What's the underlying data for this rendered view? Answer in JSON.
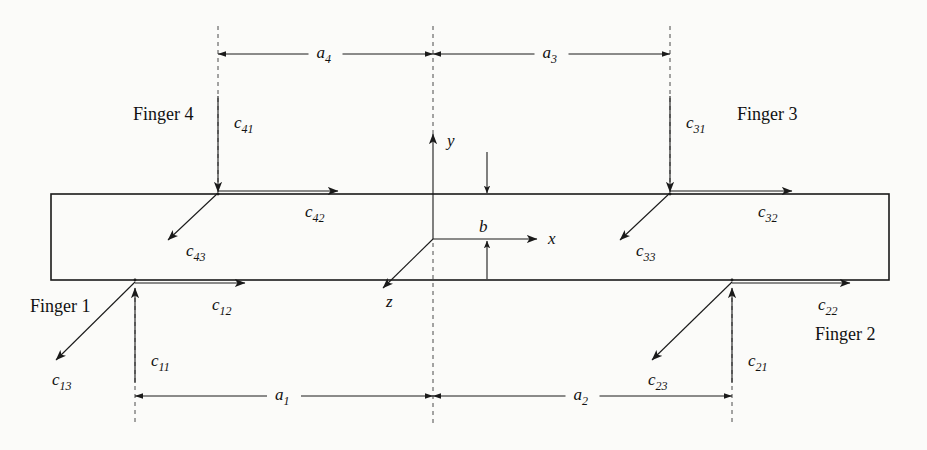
{
  "figure": {
    "background_color": "#fbfbf9",
    "ink_color": "#1a1a1a"
  },
  "object": {
    "name": "grasped-rectangular-body",
    "left": 51,
    "right": 889,
    "top": 194,
    "bottom": 280
  },
  "axes": {
    "origin": {
      "x": 433,
      "y": 239
    },
    "x_label": "x",
    "y_label": "y",
    "z_label": "z",
    "x_tip": {
      "x": 537,
      "y": 239
    },
    "y_tip": {
      "x": 433,
      "y": 134
    },
    "z_tip": {
      "x": 383,
      "y": 288
    }
  },
  "dimensions": {
    "b": {
      "label": "b",
      "label_x": 487,
      "label_y": 232,
      "top_arrow_from_y": 152,
      "top_arrow_to_y": 193,
      "bottom_arrow_from_y": 279,
      "bottom_arrow_to_y": 241,
      "arrow_x": 487
    },
    "a4": {
      "label": "a",
      "sub": "4",
      "from_x": 218,
      "to_x": 433,
      "y": 54
    },
    "a3": {
      "label": "a",
      "sub": "3",
      "from_x": 433,
      "to_x": 670,
      "y": 54
    },
    "a1": {
      "label": "a",
      "sub": "1",
      "from_x": 135,
      "to_x": 433,
      "y": 396
    },
    "a2": {
      "label": "a",
      "sub": "2",
      "from_x": 433,
      "to_x": 732,
      "y": 396
    }
  },
  "guides": [
    {
      "name": "guide-finger4",
      "x": 218,
      "y1": 26,
      "y2": 194
    },
    {
      "name": "guide-center-top",
      "x": 433,
      "y1": 26,
      "y2": 135
    },
    {
      "name": "guide-finger3",
      "x": 670,
      "y1": 26,
      "y2": 194
    },
    {
      "name": "guide-finger1",
      "x": 135,
      "y1": 290,
      "y2": 424
    },
    {
      "name": "guide-center-bottom",
      "x": 433,
      "y1": 243,
      "y2": 424
    },
    {
      "name": "guide-finger2",
      "x": 732,
      "y1": 290,
      "y2": 424
    }
  ],
  "fingers": [
    {
      "id": "finger-1",
      "name_label": "Finger 1",
      "name_x": 30,
      "name_y": 312,
      "contact": {
        "x": 135,
        "y": 280
      },
      "forces": [
        {
          "key": "c11",
          "base": "c",
          "sub": "11",
          "tip": {
            "x": 135,
            "y": 288
          },
          "tail": {
            "x": 135,
            "y": 383
          },
          "label_x": 151,
          "label_y": 366
        },
        {
          "key": "c12",
          "base": "c",
          "sub": "12",
          "tip": {
            "x": 245,
            "y": 283
          },
          "tail": {
            "x": 135,
            "y": 283
          },
          "label_x": 212,
          "label_y": 310
        },
        {
          "key": "c13",
          "base": "c",
          "sub": "13",
          "tip": {
            "x": 56,
            "y": 360
          },
          "tail": {
            "x": 135,
            "y": 282
          },
          "label_x": 52,
          "label_y": 385
        }
      ]
    },
    {
      "id": "finger-2",
      "name_label": "Finger 2",
      "name_x": 815,
      "name_y": 340,
      "contact": {
        "x": 732,
        "y": 280
      },
      "forces": [
        {
          "key": "c21",
          "base": "c",
          "sub": "21",
          "tip": {
            "x": 732,
            "y": 288
          },
          "tail": {
            "x": 732,
            "y": 383
          },
          "label_x": 748,
          "label_y": 366
        },
        {
          "key": "c22",
          "base": "c",
          "sub": "22",
          "tip": {
            "x": 850,
            "y": 283
          },
          "tail": {
            "x": 732,
            "y": 283
          },
          "label_x": 818,
          "label_y": 310
        },
        {
          "key": "c23",
          "base": "c",
          "sub": "23",
          "tip": {
            "x": 652,
            "y": 360
          },
          "tail": {
            "x": 732,
            "y": 282
          },
          "label_x": 648,
          "label_y": 385
        }
      ]
    },
    {
      "id": "finger-3",
      "name_label": "Finger 3",
      "name_x": 737,
      "name_y": 120,
      "contact": {
        "x": 670,
        "y": 194
      },
      "forces": [
        {
          "key": "c31",
          "base": "c",
          "sub": "31",
          "tip": {
            "x": 670,
            "y": 192
          },
          "tail": {
            "x": 670,
            "y": 96
          },
          "label_x": 686,
          "label_y": 128
        },
        {
          "key": "c32",
          "base": "c",
          "sub": "32",
          "tip": {
            "x": 792,
            "y": 191
          },
          "tail": {
            "x": 670,
            "y": 191
          },
          "label_x": 758,
          "label_y": 217
        },
        {
          "key": "c33",
          "base": "c",
          "sub": "33",
          "tip": {
            "x": 620,
            "y": 240
          },
          "tail": {
            "x": 670,
            "y": 193
          },
          "label_x": 636,
          "label_y": 256
        }
      ]
    },
    {
      "id": "finger-4",
      "name_label": "Finger 4",
      "name_x": 133,
      "name_y": 120,
      "contact": {
        "x": 218,
        "y": 194
      },
      "forces": [
        {
          "key": "c41",
          "base": "c",
          "sub": "41",
          "tip": {
            "x": 218,
            "y": 192
          },
          "tail": {
            "x": 218,
            "y": 96
          },
          "label_x": 234,
          "label_y": 128
        },
        {
          "key": "c42",
          "base": "c",
          "sub": "42",
          "tip": {
            "x": 338,
            "y": 191
          },
          "tail": {
            "x": 218,
            "y": 191
          },
          "label_x": 305,
          "label_y": 217
        },
        {
          "key": "c43",
          "base": "c",
          "sub": "43",
          "tip": {
            "x": 168,
            "y": 240
          },
          "tail": {
            "x": 218,
            "y": 193
          },
          "label_x": 186,
          "label_y": 256
        }
      ]
    }
  ],
  "chart_data": {
    "type": "diagram",
    "elements": [
      "rectangular object outline",
      "body-fixed coordinate frame x-y-z at center",
      "four contact points with three force components each",
      "dimension annotations a1, a2, a3, a4, b"
    ],
    "annotations": [
      "c11",
      "c12",
      "c13",
      "c21",
      "c22",
      "c23",
      "c31",
      "c32",
      "c33",
      "c41",
      "c42",
      "c43",
      "a1",
      "a2",
      "a3",
      "a4",
      "b",
      "x",
      "y",
      "z",
      "Finger 1",
      "Finger 2",
      "Finger 3",
      "Finger 4"
    ]
  }
}
